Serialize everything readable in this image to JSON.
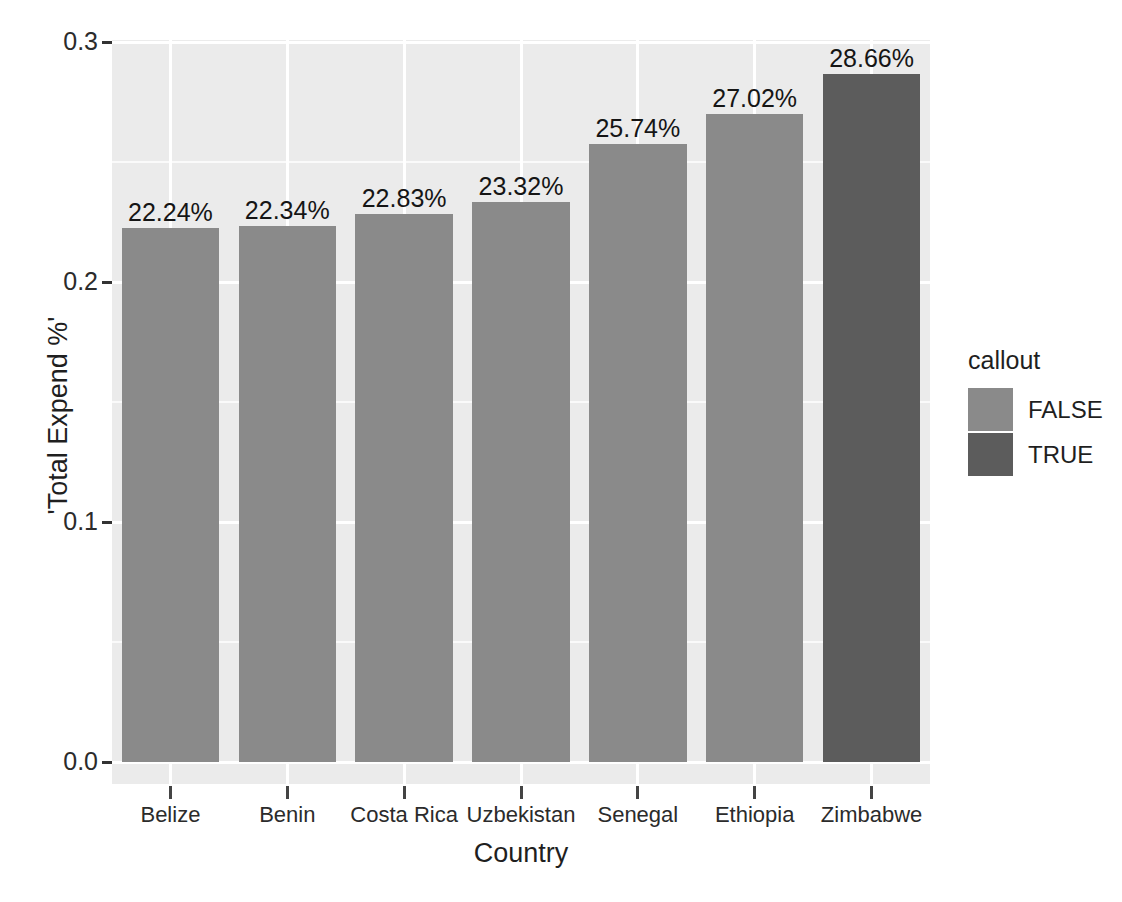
{
  "chart_data": {
    "type": "bar",
    "title": "",
    "xlabel": "Country",
    "ylabel": "'Total Expend %'",
    "categories": [
      "Belize",
      "Benin",
      "Costa Rica",
      "Uzbekistan",
      "Senegal",
      "Ethiopia",
      "Zimbabwe"
    ],
    "values": [
      0.2224,
      0.2234,
      0.2283,
      0.2332,
      0.2574,
      0.2702,
      0.2866
    ],
    "data_labels": [
      "22.24%",
      "22.34%",
      "22.83%",
      "23.32%",
      "25.74%",
      "27.02%",
      "28.66%"
    ],
    "group": [
      "FALSE",
      "FALSE",
      "FALSE",
      "FALSE",
      "FALSE",
      "FALSE",
      "TRUE"
    ],
    "ylim": [
      0.0,
      0.3
    ],
    "y_ticks": [
      "0.0",
      "0.1",
      "0.2",
      "0.3"
    ],
    "y_tick_values": [
      0.0,
      0.1,
      0.2,
      0.3
    ],
    "grid": true,
    "legend_position": "right",
    "legend": {
      "title": "callout",
      "entries": [
        {
          "label": "FALSE",
          "color": "#8a8a8a"
        },
        {
          "label": "TRUE",
          "color": "#5c5c5c"
        }
      ]
    },
    "colors": {
      "false_bar": "#8a8a8a",
      "true_bar": "#5c5c5c",
      "panel_background": "#ebebeb",
      "gridline": "#ffffff",
      "text": "#1f1f1f"
    }
  }
}
